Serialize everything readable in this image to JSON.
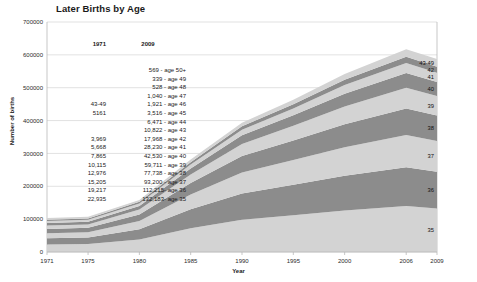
{
  "chart_data": {
    "type": "area",
    "title": "Later Births by Age",
    "xlabel": "Year",
    "ylabel": "Number of births",
    "xlim": [
      1971,
      2009
    ],
    "ylim": [
      0,
      700000
    ],
    "ytick_labels": [
      "0",
      "100000",
      "200000",
      "300000",
      "400000",
      "500000",
      "600000",
      "700000"
    ],
    "ytick_values": [
      0,
      100000,
      200000,
      300000,
      400000,
      500000,
      600000,
      700000
    ],
    "xtick_labels": [
      "1971",
      "1975",
      "1980",
      "1985",
      "1990",
      "1995",
      "2000",
      "2006",
      "2009"
    ],
    "xtick_values": [
      1971,
      1975,
      1980,
      1985,
      1990,
      1995,
      2000,
      2006,
      2009
    ],
    "grid": "horizontal",
    "legend": "right-edge-inline",
    "x": [
      1971,
      1975,
      1980,
      1985,
      1990,
      1995,
      2000,
      2006,
      2009
    ],
    "series": [
      {
        "name": "35",
        "label": "35",
        "color": "#d3d3d3",
        "values": [
          22935,
          24000,
          38000,
          72000,
          98000,
          112000,
          126000,
          140000,
          132183
        ]
      },
      {
        "name": "36",
        "label": "36",
        "color": "#8c8c8c",
        "values": [
          19217,
          20000,
          31000,
          58000,
          80000,
          93000,
          106000,
          118000,
          112215
        ]
      },
      {
        "name": "37",
        "label": "37",
        "color": "#d3d3d3",
        "values": [
          15205,
          16000,
          25000,
          45000,
          64000,
          75000,
          87000,
          98000,
          93200
        ]
      },
      {
        "name": "38",
        "label": "38",
        "color": "#8c8c8c",
        "values": [
          12976,
          13500,
          20000,
          35000,
          50000,
          59000,
          70000,
          81000,
          77738
        ]
      },
      {
        "name": "39",
        "label": "39",
        "color": "#d3d3d3",
        "values": [
          10115,
          10500,
          15000,
          26000,
          37000,
          45000,
          54000,
          63000,
          59711
        ]
      },
      {
        "name": "40",
        "label": "40",
        "color": "#8c8c8c",
        "values": [
          7865,
          8100,
          11000,
          18000,
          26000,
          32000,
          39000,
          45000,
          42530
        ]
      },
      {
        "name": "41",
        "label": "41",
        "color": "#d3d3d3",
        "values": [
          5668,
          5900,
          7600,
          12000,
          17000,
          21000,
          26000,
          30000,
          28230
        ]
      },
      {
        "name": "42",
        "label": "42",
        "color": "#8c8c8c",
        "values": [
          3969,
          4100,
          5000,
          7500,
          10500,
          13000,
          16500,
          19000,
          17968
        ]
      },
      {
        "name": "43-49",
        "label": "43-49",
        "color": "#d3d3d3",
        "values": [
          5161,
          5200,
          6000,
          8000,
          10500,
          13000,
          17000,
          23000,
          23815
        ]
      }
    ]
  },
  "table": {
    "header_1971": "1971",
    "header_2009": "2009",
    "rows_1971": [
      "",
      "",
      "",
      "",
      "43-49",
      "5161",
      "",
      "",
      "3,969",
      "5,668",
      "7,865",
      "10,115",
      "12,976",
      "15,205",
      "19,217",
      "22,935"
    ],
    "rows_2009": [
      "569 - age 50+",
      "339 - age 49",
      "528 - age 48",
      "1,040 - age 47",
      "1,921 - age 46",
      "3,516 - age 45",
      "6,471 - age 44",
      "10,822 - age 43",
      "17,968 - age 42",
      "28,230 - age 41",
      "42,530 - age 40",
      "59,711 - age 39",
      "77,738 - age 38",
      "93,200 - age 37",
      "112,215- age 36",
      "132,183- age 35"
    ]
  },
  "colors": {
    "band_light": "#d3d3d3",
    "band_dark": "#8c8c8c",
    "gridline": "#d4d4d4",
    "background": "#ffffff"
  }
}
